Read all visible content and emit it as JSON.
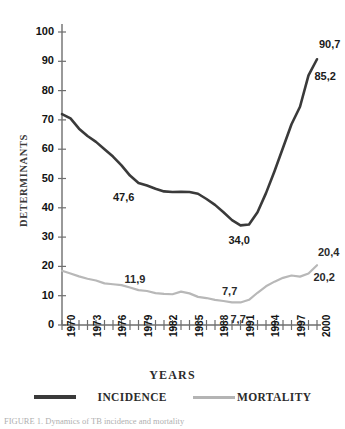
{
  "chart_data": {
    "type": "line",
    "title": "",
    "xlabel": "YEARS",
    "ylabel": "DETERMINANTS",
    "xlim": [
      1970,
      2000
    ],
    "ylim": [
      0,
      100
    ],
    "ytick_labels": [
      "0",
      "10",
      "20",
      "30",
      "40",
      "50",
      "60",
      "70",
      "80",
      "90",
      "100"
    ],
    "ytick_values": [
      0,
      10,
      20,
      30,
      40,
      50,
      60,
      70,
      80,
      90,
      100
    ],
    "xtick_labels": [
      "1970",
      "1973",
      "1976",
      "1979",
      "1982",
      "1985",
      "1988",
      "1991",
      "1994",
      "1997",
      "2000"
    ],
    "xtick_values": [
      1970,
      1973,
      1976,
      1979,
      1982,
      1985,
      1988,
      1991,
      1994,
      1997,
      2000
    ],
    "minor_xticks_every": 1,
    "grid": false,
    "legend_position": "below-axis",
    "x": [
      1970,
      1971,
      1972,
      1973,
      1974,
      1975,
      1976,
      1977,
      1978,
      1979,
      1980,
      1981,
      1982,
      1983,
      1984,
      1985,
      1986,
      1987,
      1988,
      1989,
      1990,
      1991,
      1992,
      1993,
      1994,
      1995,
      1996,
      1997,
      1998,
      1999,
      2000
    ],
    "series": [
      {
        "name": "INCIDENCE",
        "color": "#3a3a3a",
        "width": 2.6,
        "values": [
          72.0,
          70.5,
          67.0,
          64.5,
          62.5,
          60.0,
          57.5,
          54.5,
          51.0,
          48.5,
          47.6,
          46.5,
          45.6,
          45.4,
          45.5,
          45.4,
          44.8,
          43.0,
          41.0,
          38.5,
          35.8,
          34.0,
          34.3,
          38.5,
          45.0,
          52.5,
          60.5,
          68.5,
          74.5,
          85.2,
          90.7
        ]
      },
      {
        "name": "MORTALITY",
        "color": "#b8b8b8",
        "width": 2.2,
        "values": [
          18.5,
          17.6,
          16.6,
          15.8,
          15.2,
          14.2,
          13.9,
          13.6,
          12.8,
          11.9,
          11.6,
          10.9,
          10.6,
          10.5,
          11.4,
          10.8,
          9.6,
          9.2,
          8.6,
          8.2,
          7.7,
          7.7,
          8.6,
          11.0,
          13.2,
          14.8,
          16.1,
          16.9,
          16.5,
          17.6,
          20.4
        ]
      }
    ],
    "annotations": [
      {
        "label": "47,6",
        "series": "INCIDENCE",
        "x": 1980,
        "y": 47.6
      },
      {
        "label": "34,0",
        "series": "INCIDENCE",
        "x": 1991,
        "y": 34.0
      },
      {
        "label": "85,2",
        "series": "INCIDENCE",
        "x": 1999,
        "y": 85.2
      },
      {
        "label": "90,7",
        "series": "INCIDENCE",
        "x": 2000,
        "y": 90.7
      },
      {
        "label": "11,9",
        "series": "MORTALITY",
        "x": 1979,
        "y": 11.9
      },
      {
        "label": "7,7",
        "series": "MORTALITY",
        "x": 1990,
        "y": 7.7
      },
      {
        "label": "7,7",
        "series": "MORTALITY",
        "x": 1991,
        "y": 7.7
      },
      {
        "label": "20,2",
        "series": "MORTALITY",
        "x": 1999,
        "y": 20.2
      },
      {
        "label": "20,4",
        "series": "MORTALITY",
        "x": 2000,
        "y": 20.4
      }
    ]
  },
  "legend": {
    "incidence_label": "INCIDENCE",
    "mortality_label": "MORTALITY"
  },
  "caption": {
    "text": "FIGURE 1. Dynamics of TB incidence and mortality"
  },
  "colors": {
    "incidence": "#3a3a3a",
    "mortality": "#b8b8b8",
    "axis": "#6e6e6e",
    "text": "#1a1a1a"
  }
}
